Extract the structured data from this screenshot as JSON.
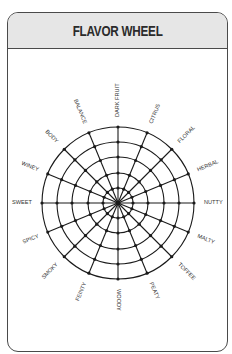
{
  "header": {
    "title": "FLAVOR WHEEL"
  },
  "wheel": {
    "center": [
      118,
      203
    ],
    "ring_radii": [
      15,
      30,
      46,
      61,
      76
    ],
    "label_radius": 86,
    "line_color": "#1a1a1a",
    "labels": [
      "DARK FRUIT",
      "CITRUS",
      "FLORAL",
      "HERBAL",
      "NUTTY",
      "MALTY",
      "TOFFEE",
      "PEATY",
      "WOODY",
      "FEINTY",
      "SMOKY",
      "SPICY",
      "SWEET",
      "WINEY",
      "BODY",
      "BALANCE"
    ]
  }
}
